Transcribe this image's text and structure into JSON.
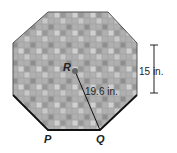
{
  "figure": {
    "shape": "regular-octagon",
    "fill_pattern": "gray-tile-mosaic",
    "center_label": "R",
    "vertex_labels": [
      "P",
      "Q"
    ],
    "radius_label": "19.6 in.",
    "side_length_label": "15 in.",
    "colors": {
      "tile_base": "#a8a8a8",
      "outline": "#555555",
      "highlight_side": "#111111"
    }
  }
}
